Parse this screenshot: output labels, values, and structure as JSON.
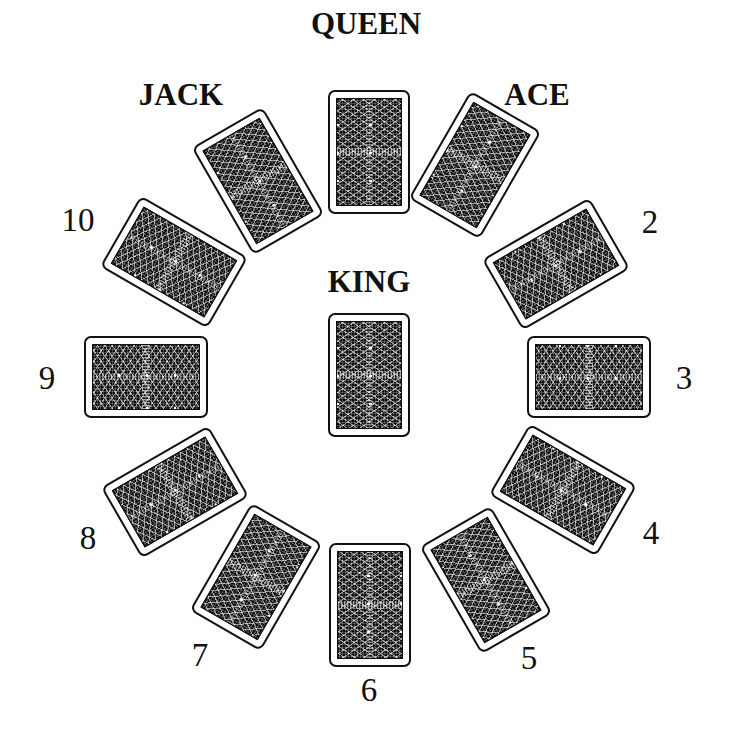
{
  "diagram": {
    "type": "card-spread",
    "card_back_color": "#0d0d0d",
    "card_border_color": "#111111",
    "background_color": "#ffffff"
  },
  "positions": [
    {
      "id": "queen",
      "label": "QUEEN",
      "card": {
        "x": 369,
        "y": 152,
        "rotate": 0
      },
      "label_pos": {
        "x": 366,
        "y": 24
      },
      "style": "word"
    },
    {
      "id": "ace",
      "label": "ACE",
      "card": {
        "x": 475,
        "y": 165,
        "rotate": 30
      },
      "label_pos": {
        "x": 537,
        "y": 95
      },
      "style": "word"
    },
    {
      "id": "two",
      "label": "2",
      "card": {
        "x": 556,
        "y": 264,
        "rotate": 60
      },
      "label_pos": {
        "x": 650,
        "y": 222
      },
      "style": "num"
    },
    {
      "id": "three",
      "label": "3",
      "card": {
        "x": 589,
        "y": 377,
        "rotate": 90
      },
      "label_pos": {
        "x": 684,
        "y": 378
      },
      "style": "num"
    },
    {
      "id": "four",
      "label": "4",
      "card": {
        "x": 563,
        "y": 490,
        "rotate": 120
      },
      "label_pos": {
        "x": 651,
        "y": 533
      },
      "style": "num"
    },
    {
      "id": "five",
      "label": "5",
      "card": {
        "x": 486,
        "y": 580,
        "rotate": 150
      },
      "label_pos": {
        "x": 529,
        "y": 658
      },
      "style": "num"
    },
    {
      "id": "six",
      "label": "6",
      "card": {
        "x": 370,
        "y": 605,
        "rotate": 180
      },
      "label_pos": {
        "x": 369,
        "y": 690
      },
      "style": "num"
    },
    {
      "id": "seven",
      "label": "7",
      "card": {
        "x": 256,
        "y": 577,
        "rotate": 210
      },
      "label_pos": {
        "x": 200,
        "y": 655
      },
      "style": "num"
    },
    {
      "id": "eight",
      "label": "8",
      "card": {
        "x": 175,
        "y": 492,
        "rotate": 240
      },
      "label_pos": {
        "x": 88,
        "y": 538
      },
      "style": "num"
    },
    {
      "id": "nine",
      "label": "9",
      "card": {
        "x": 146,
        "y": 377,
        "rotate": 270
      },
      "label_pos": {
        "x": 47,
        "y": 378
      },
      "style": "num"
    },
    {
      "id": "ten",
      "label": "10",
      "card": {
        "x": 174,
        "y": 262,
        "rotate": 300
      },
      "label_pos": {
        "x": 78,
        "y": 220
      },
      "style": "num"
    },
    {
      "id": "jack",
      "label": "JACK",
      "card": {
        "x": 258,
        "y": 181,
        "rotate": 330
      },
      "label_pos": {
        "x": 181,
        "y": 95
      },
      "style": "word"
    },
    {
      "id": "king",
      "label": "KING",
      "card": {
        "x": 369,
        "y": 375,
        "rotate": 0
      },
      "label_pos": {
        "x": 369,
        "y": 282
      },
      "style": "word"
    }
  ]
}
